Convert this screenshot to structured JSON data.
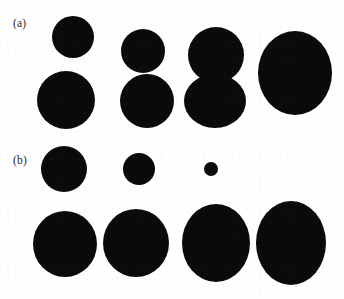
{
  "figure": {
    "background_color": "#fefefe",
    "shape_color": "#0a0a0a",
    "width": 344,
    "height": 299,
    "panels": [
      {
        "id": "a",
        "label": "(a)",
        "label_x": 13,
        "label_y": 18,
        "columns": [
          {
            "index": 1,
            "shapes": [
              {
                "name": "top-circle",
                "cx": 73,
                "cy": 37,
                "rx": 21,
                "ry": 21
              },
              {
                "name": "bottom-circle",
                "cx": 66,
                "cy": 100,
                "rx": 29,
                "ry": 29
              }
            ]
          },
          {
            "index": 2,
            "shapes": [
              {
                "name": "top-circle",
                "cx": 143,
                "cy": 51,
                "rx": 22,
                "ry": 22
              },
              {
                "name": "bottom-circle",
                "cx": 147,
                "cy": 101,
                "rx": 27,
                "ry": 27
              }
            ]
          },
          {
            "index": 3,
            "shapes": [
              {
                "name": "top-circle",
                "cx": 216,
                "cy": 55,
                "rx": 28,
                "ry": 28
              },
              {
                "name": "bottom-circle",
                "cx": 215,
                "cy": 101,
                "rx": 31,
                "ry": 27
              }
            ]
          },
          {
            "index": 4,
            "shapes": [
              {
                "name": "merged-ellipse",
                "cx": 295,
                "cy": 73,
                "rx": 37,
                "ry": 42
              }
            ]
          }
        ]
      },
      {
        "id": "b",
        "label": "(b)",
        "label_x": 13,
        "label_y": 155,
        "columns": [
          {
            "index": 1,
            "shapes": [
              {
                "name": "top-circle",
                "cx": 64,
                "cy": 169,
                "rx": 23,
                "ry": 23
              },
              {
                "name": "bottom-circle",
                "cx": 65,
                "cy": 244,
                "rx": 32,
                "ry": 33
              }
            ]
          },
          {
            "index": 2,
            "shapes": [
              {
                "name": "top-circle",
                "cx": 139,
                "cy": 169,
                "rx": 16,
                "ry": 16
              },
              {
                "name": "bottom-circle",
                "cx": 136,
                "cy": 243,
                "rx": 33,
                "ry": 34
              }
            ]
          },
          {
            "index": 3,
            "shapes": [
              {
                "name": "top-circle",
                "cx": 211,
                "cy": 169,
                "rx": 7,
                "ry": 7
              },
              {
                "name": "bottom-circle",
                "cx": 216,
                "cy": 243,
                "rx": 34,
                "ry": 39
              }
            ]
          },
          {
            "index": 4,
            "shapes": [
              {
                "name": "bottom-circle",
                "cx": 291,
                "cy": 243,
                "rx": 35,
                "ry": 42
              }
            ]
          }
        ]
      }
    ]
  },
  "chart_data": {
    "type": "scatter",
    "title": "",
    "xlabel": "",
    "ylabel": "",
    "series": [
      {
        "name": "panel-a-upper-blob-radius",
        "x": [
          1,
          2,
          3,
          4
        ],
        "values": [
          21,
          22,
          28,
          0
        ]
      },
      {
        "name": "panel-a-lower-blob-radius",
        "x": [
          1,
          2,
          3,
          4
        ],
        "values": [
          29,
          27,
          29,
          39
        ]
      },
      {
        "name": "panel-b-upper-blob-radius",
        "x": [
          1,
          2,
          3,
          4
        ],
        "values": [
          23,
          16,
          7,
          0
        ]
      },
      {
        "name": "panel-b-lower-blob-radius",
        "x": [
          1,
          2,
          3,
          4
        ],
        "values": [
          32,
          33,
          36,
          38
        ]
      }
    ]
  }
}
